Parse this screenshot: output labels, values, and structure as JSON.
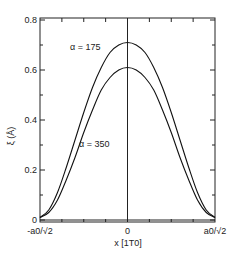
{
  "chart_data": {
    "type": "line",
    "title": "",
    "xlabel": "x [1T0]",
    "ylabel": "ξ (Å)",
    "xlim": [
      -1,
      1
    ],
    "ylim": [
      0,
      0.82
    ],
    "x_tick_labels": [
      {
        "x": -1,
        "label": "-a0/√2"
      },
      {
        "x": 0,
        "label": "0"
      },
      {
        "x": 1,
        "label": "a0/√2"
      }
    ],
    "y_ticks": [
      0,
      0.2,
      0.4,
      0.6,
      0.8
    ],
    "y_tick_labels": [
      "0",
      "0.2",
      "0.4",
      "0.6",
      "0.8"
    ],
    "grid": false,
    "center_line_x": 0,
    "series": [
      {
        "name": "α = 175",
        "peak": 0.71,
        "x": [
          -1,
          -0.9,
          -0.8,
          -0.7,
          -0.6,
          -0.5,
          -0.4,
          -0.3,
          -0.2,
          -0.1,
          0,
          0.1,
          0.2,
          0.3,
          0.4,
          0.5,
          0.6,
          0.7,
          0.8,
          0.9,
          1
        ],
        "values": [
          0.01,
          0.04,
          0.11,
          0.21,
          0.32,
          0.43,
          0.53,
          0.61,
          0.67,
          0.7,
          0.71,
          0.7,
          0.67,
          0.61,
          0.53,
          0.43,
          0.32,
          0.21,
          0.11,
          0.04,
          0.01
        ]
      },
      {
        "name": "α = 350",
        "peak": 0.61,
        "x": [
          -1,
          -0.9,
          -0.8,
          -0.7,
          -0.6,
          -0.5,
          -0.4,
          -0.3,
          -0.2,
          -0.1,
          0,
          0.1,
          0.2,
          0.3,
          0.4,
          0.5,
          0.6,
          0.7,
          0.8,
          0.9,
          1
        ],
        "values": [
          0.01,
          0.03,
          0.08,
          0.16,
          0.25,
          0.35,
          0.44,
          0.52,
          0.57,
          0.6,
          0.61,
          0.6,
          0.57,
          0.52,
          0.44,
          0.35,
          0.25,
          0.16,
          0.08,
          0.03,
          0.01
        ]
      }
    ],
    "annotations": [
      {
        "text": "α = 175",
        "series": 0
      },
      {
        "text": "α = 350",
        "series": 1
      }
    ]
  }
}
